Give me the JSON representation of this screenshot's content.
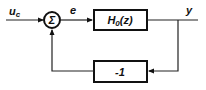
{
  "diagram": {
    "type": "block-diagram",
    "input_signal": "u",
    "input_subscript": "c",
    "error_signal": "e",
    "output_signal": "y",
    "sum_symbol": "Σ",
    "forward_block": {
      "label_main": "H",
      "label_subscript": "0",
      "label_arg": "(z)"
    },
    "feedback_block": {
      "label": "-1"
    }
  }
}
